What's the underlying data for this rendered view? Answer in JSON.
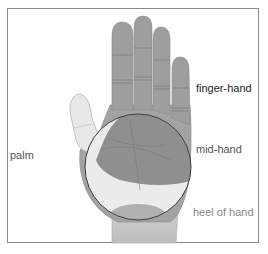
{
  "diagram": {
    "type": "anatomical-hand-regions",
    "labels": {
      "finger_hand": "finger-hand",
      "mid_hand": "mid-hand",
      "palm": "palm",
      "heel_of_hand": "heel of hand"
    },
    "colors": {
      "frame": "#8a8a8a",
      "hand_shade": "#9a9a9a",
      "hand_light": "#e6e6e6",
      "circle_outline": "#3a3a3a"
    }
  }
}
